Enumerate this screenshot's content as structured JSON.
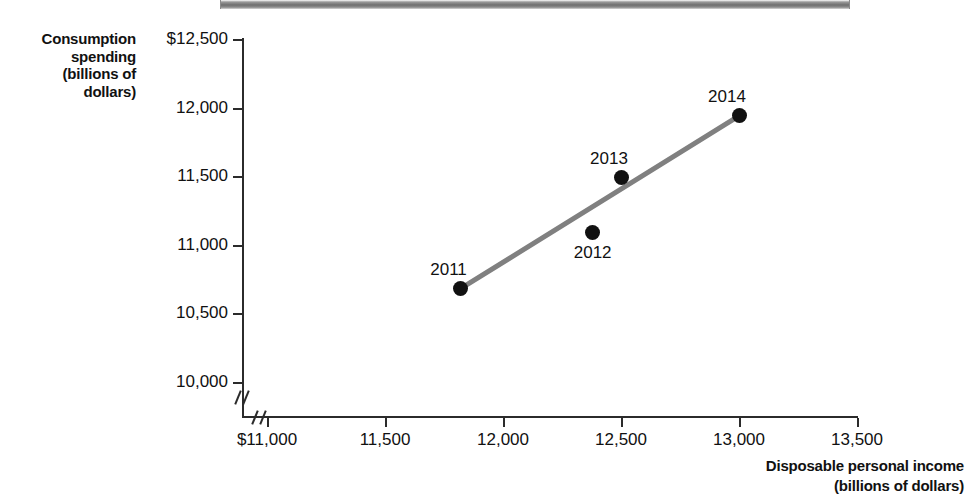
{
  "figure": {
    "title_bar_present": true,
    "background_color": "#ffffff",
    "axis_color": "#2b2b2b",
    "marker_color": "#111111",
    "trend_line_color": "#808080"
  },
  "axes": {
    "y_title_lines": [
      "Consumption",
      "spending",
      "(billions of",
      "dollars)"
    ],
    "x_title_lines": [
      "Disposable personal income",
      "(billions of dollars)"
    ],
    "y_tick_labels": [
      "$12,500",
      "12,000",
      "11,500",
      "11,000",
      "10,500",
      "10,000"
    ],
    "x_tick_labels": [
      "$11,000",
      "11,500",
      "12,000",
      "12,500",
      "13,000",
      "13,500"
    ]
  },
  "chart_data": {
    "type": "scatter",
    "title": "",
    "xlabel": "Disposable personal income (billions of dollars)",
    "ylabel": "Consumption spending (billions of dollars)",
    "xlim": [
      11000,
      13500
    ],
    "ylim": [
      10000,
      12500
    ],
    "xticks": [
      11000,
      11500,
      12000,
      12500,
      13000,
      13500
    ],
    "yticks": [
      10000,
      10500,
      11000,
      11500,
      12000,
      12500
    ],
    "grid": false,
    "legend": "none",
    "axis_break_x": true,
    "axis_break_y": true,
    "points": [
      {
        "label": "2011",
        "x": 11820,
        "y": 10680,
        "label_position": "above-left"
      },
      {
        "label": "2012",
        "x": 12380,
        "y": 11090,
        "label_position": "below"
      },
      {
        "label": "2013",
        "x": 12500,
        "y": 11490,
        "label_position": "above-left"
      },
      {
        "label": "2014",
        "x": 13000,
        "y": 11940,
        "label_position": "above-left"
      }
    ],
    "trend_line": {
      "name": "fitted line",
      "color": "#808080",
      "width_px": 5,
      "from": {
        "x": 11820,
        "y": 10680
      },
      "to": {
        "x": 13000,
        "y": 11940
      }
    }
  }
}
